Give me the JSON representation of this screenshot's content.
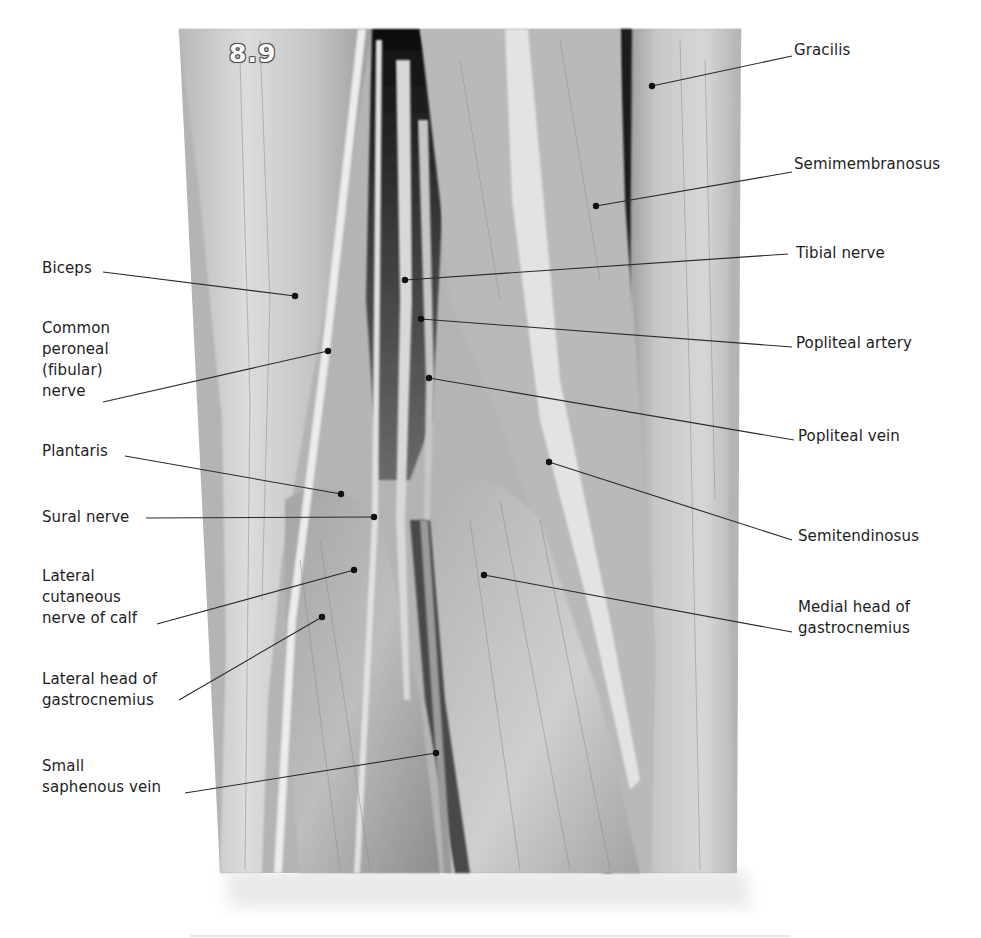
{
  "figure": {
    "number": "8.9",
    "photo_bounds": {
      "top_left": [
        179,
        29
      ],
      "top_right": [
        741,
        29
      ],
      "bottom_left": [
        220,
        873
      ],
      "bottom_right": [
        737,
        873
      ]
    },
    "colors": {
      "background": "#ffffff",
      "label_text": "#1d1d1d",
      "leader_line": "#2a2a2a",
      "dot": "#111111"
    }
  },
  "labels": {
    "left": [
      {
        "id": "biceps",
        "text": "Biceps",
        "x": 42,
        "y": 258,
        "line_start": [
          103,
          272
        ],
        "dot": [
          295,
          296
        ]
      },
      {
        "id": "common-peroneal-nerve",
        "text": "Common\nperoneal\n(fibular)\nnerve",
        "x": 42,
        "y": 318,
        "line_start": [
          103,
          402
        ],
        "dot": [
          328,
          351
        ]
      },
      {
        "id": "plantaris",
        "text": "Plantaris",
        "x": 42,
        "y": 441,
        "line_start": [
          125,
          456
        ],
        "dot": [
          341,
          494
        ]
      },
      {
        "id": "sural-nerve",
        "text": "Sural nerve",
        "x": 42,
        "y": 507,
        "line_start": [
          146,
          518
        ],
        "dot": [
          374,
          517
        ]
      },
      {
        "id": "lateral-cutaneous-nerve-of-calf",
        "text": "Lateral\ncutaneous\nnerve of calf",
        "x": 42,
        "y": 566,
        "line_start": [
          157,
          624
        ],
        "dot": [
          354,
          570
        ]
      },
      {
        "id": "lateral-head-of-gastrocnemius",
        "text": "Lateral head of\ngastrocnemius",
        "x": 42,
        "y": 669,
        "line_start": [
          179,
          700
        ],
        "dot": [
          322,
          617
        ]
      },
      {
        "id": "small-saphenous-vein",
        "text": "Small\nsaphenous vein",
        "x": 42,
        "y": 756,
        "line_start": [
          185,
          793
        ],
        "dot": [
          436,
          753
        ]
      }
    ],
    "right": [
      {
        "id": "gracilis",
        "text": "Gracilis",
        "x": 794,
        "y": 40,
        "line_start": [
          792,
          56
        ],
        "dot": [
          652,
          86
        ]
      },
      {
        "id": "semimembranosus",
        "text": "Semimembranosus",
        "x": 794,
        "y": 154,
        "line_start": [
          792,
          172
        ],
        "dot": [
          596,
          206
        ]
      },
      {
        "id": "tibial-nerve",
        "text": "Tibial nerve",
        "x": 796,
        "y": 243,
        "line_start": [
          788,
          254
        ],
        "dot": [
          405,
          280
        ]
      },
      {
        "id": "popliteal-artery",
        "text": "Popliteal artery",
        "x": 796,
        "y": 333,
        "line_start": [
          792,
          347
        ],
        "dot": [
          421,
          319
        ]
      },
      {
        "id": "popliteal-vein",
        "text": "Popliteal vein",
        "x": 798,
        "y": 426,
        "line_start": [
          794,
          440
        ],
        "dot": [
          429,
          378
        ]
      },
      {
        "id": "semitendinosus",
        "text": "Semitendinosus",
        "x": 798,
        "y": 526,
        "line_start": [
          792,
          540
        ],
        "dot": [
          549,
          462
        ]
      },
      {
        "id": "medial-head-of-gastrocnemius",
        "text": "Medial head of\ngastrocnemius",
        "x": 798,
        "y": 597,
        "line_start": [
          792,
          632
        ],
        "dot": [
          484,
          575
        ]
      }
    ]
  }
}
